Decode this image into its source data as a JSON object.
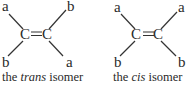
{
  "figure": {
    "trans": {
      "top_left": "a",
      "top_right": "b",
      "bottom_left": "b",
      "bottom_right": "a",
      "left_carbon": "C",
      "right_carbon": "C",
      "bond": "=",
      "caption_prefix": "the ",
      "caption_italic": "trans",
      "caption_suffix": " isomer"
    },
    "cis": {
      "top_left": "a",
      "top_right": "a",
      "bottom_left": "b",
      "bottom_right": "b",
      "left_carbon": "C",
      "right_carbon": "C",
      "bond": "=",
      "caption_prefix": "the ",
      "caption_italic": "cis",
      "caption_suffix": " isomer"
    }
  }
}
